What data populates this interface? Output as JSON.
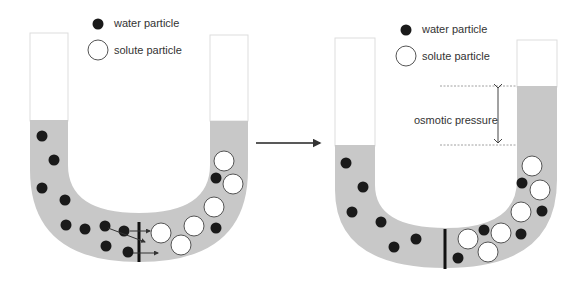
{
  "colors": {
    "liquid": "#c8c8c8",
    "tube_outline": "#dddddd",
    "water_particle": "#1a1a1a",
    "solute_fill": "#ffffff",
    "solute_stroke": "#555555",
    "membrane": "#111111",
    "arrow": "#333333"
  },
  "left_panel": {
    "legend": {
      "water_label": "water particle",
      "solute_label": "solute particle"
    }
  },
  "right_panel": {
    "legend": {
      "water_label": "water particle",
      "solute_label": "solute particle"
    },
    "annotation": "osmotic pressure"
  }
}
